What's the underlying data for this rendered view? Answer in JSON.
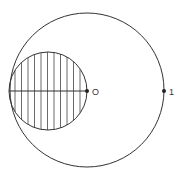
{
  "diagram": {
    "type": "geometric",
    "stroke_color": "#333333",
    "background": "#ffffff",
    "outer_circle": {
      "cx": 87,
      "cy": 90,
      "r": 77
    },
    "inner_circle": {
      "cx": 48,
      "cy": 91,
      "r": 39,
      "hatched": true,
      "hatch_direction": "vertical",
      "hatch_count": 11
    },
    "diameter_line": {
      "x1": 9,
      "y1": 91,
      "x2": 87,
      "y2": 91
    },
    "points": [
      {
        "id": "O",
        "label": "O",
        "x": 87,
        "y": 91
      },
      {
        "id": "one",
        "label": "1",
        "x": 164,
        "y": 91
      }
    ]
  }
}
